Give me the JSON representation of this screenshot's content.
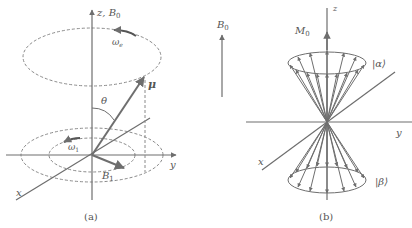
{
  "panel_a": {
    "caption": "(a)",
    "z_axis_label": "z, B",
    "z_axis_sub": "0",
    "omega_top_label": "ω",
    "omega_top_sub": "e",
    "mu_label": "μ",
    "theta_label": "θ",
    "omega1_label": "ω",
    "omega1_sub": "1",
    "b1_label": "B",
    "b1_sub": "1",
    "x_label": "x",
    "y_label": "y"
  },
  "panel_b": {
    "caption": "(b)",
    "b0_label": "B",
    "b0_sub": "0",
    "m0_label": "M",
    "m0_sub": "0",
    "z_label": "z",
    "alpha_label": "|α⟩",
    "beta_label": "|β⟩",
    "x_label": "x",
    "y_label": "y"
  },
  "colors": {
    "line": "#6e6e6e",
    "dashed": "#8a8a8a",
    "text": "#555555"
  }
}
